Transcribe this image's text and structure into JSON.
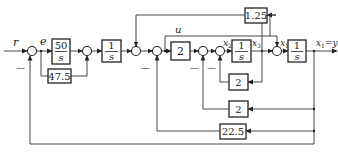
{
  "diagram": {
    "type": "control-system-block-diagram",
    "signals": {
      "input": "r",
      "error": "e",
      "control": "u",
      "state_x2": "x",
      "state_x2_sub": "2",
      "state_x3": "x",
      "state_x3_sub": "3",
      "state_x1": "x",
      "state_x1_sub": "1",
      "output": "x",
      "output_sub": "1",
      "output_eq": "=y"
    },
    "blocks": {
      "integrator_gain_num": "50",
      "integrator_gain_den": "s",
      "integrator1_num": "1",
      "integrator1_den": "s",
      "gain_forward": "2",
      "integrator2_num": "1",
      "integrator2_den": "s",
      "integrator3_num": "1",
      "integrator3_den": "s",
      "gain_e": "47.5",
      "gain_top": "1.25",
      "gain_fb_x3": "2",
      "gain_fb_x1a": "2",
      "gain_fb_x1b": "22.5"
    },
    "signs": {
      "sum1_bottom": "—",
      "sum4_bottom": "—",
      "sum5_bottom": "—",
      "sum6_bottom": "—"
    }
  }
}
